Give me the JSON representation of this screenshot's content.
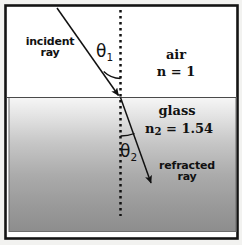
{
  "figure": {
    "frame": {
      "border_color": "#141414",
      "background_color": "#ffffff",
      "outer_background_color": "#f2f2f0"
    },
    "media": {
      "upper": {
        "name": "air",
        "index_label": "n = 1",
        "fill_color": "#ffffff"
      },
      "lower": {
        "name": "glass",
        "index_label_prefix": "n",
        "index_label_subscript": "2",
        "index_label_value": " = 1.54",
        "index_label_full": "n2 = 1.54",
        "gradient_top_color": "#f4f4f4",
        "gradient_bottom_color": "#8e8e8e"
      }
    },
    "rays": {
      "incident": {
        "label_line_1": "incident",
        "label_line_2": "ray",
        "color": "#111111"
      },
      "refracted": {
        "label_line_1": "refracted",
        "label_line_2": "ray",
        "color": "#111111"
      },
      "normal": {
        "style": "dotted",
        "color": "#111111"
      }
    },
    "angles": {
      "incidence": {
        "symbol": "θ",
        "subscript": "1",
        "full": "θ1"
      },
      "refraction": {
        "symbol": "θ",
        "subscript": "2",
        "full": "θ2"
      }
    }
  }
}
